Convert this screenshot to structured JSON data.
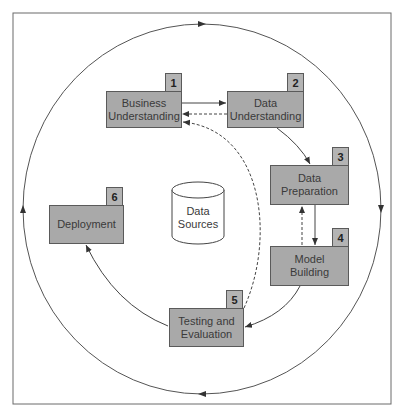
{
  "diagram": {
    "frame": {
      "border_color": "#6a6a6a"
    },
    "colors": {
      "box_fill": "#a9a9a9",
      "box_border": "#5a5a5a",
      "line": "#4a4a4a"
    },
    "center": {
      "label": "Data\nSources",
      "shape": "cylinder"
    },
    "phases": [
      {
        "number": "1",
        "label": "Business\nUnderstanding"
      },
      {
        "number": "2",
        "label": "Data\nUnderstanding"
      },
      {
        "number": "3",
        "label": "Data\nPreparation"
      },
      {
        "number": "4",
        "label": "Model\nBuilding"
      },
      {
        "number": "5",
        "label": "Testing and\nEvaluation"
      },
      {
        "number": "6",
        "label": "Deployment"
      }
    ],
    "connections": [
      {
        "from": "1",
        "to": "2",
        "style": "solid"
      },
      {
        "from": "2",
        "to": "1",
        "style": "dashed"
      },
      {
        "from": "2",
        "to": "3",
        "style": "solid"
      },
      {
        "from": "3",
        "to": "4",
        "style": "solid"
      },
      {
        "from": "4",
        "to": "3",
        "style": "dashed"
      },
      {
        "from": "4",
        "to": "5",
        "style": "solid"
      },
      {
        "from": "5",
        "to": "1",
        "style": "dashed"
      },
      {
        "from": "5",
        "to": "6",
        "style": "solid"
      }
    ],
    "outer_cycle": {
      "direction": "clockwise"
    }
  }
}
